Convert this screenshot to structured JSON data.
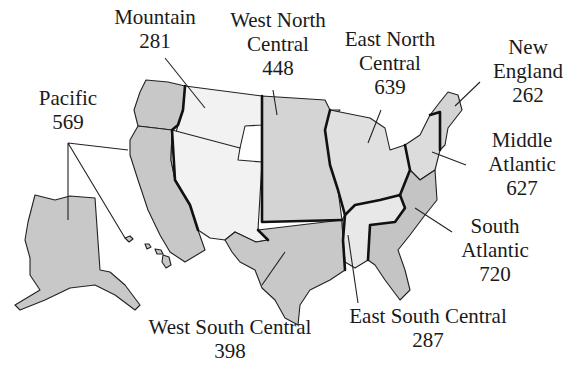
{
  "map": {
    "type": "choropleth-divisions",
    "subject": "United States census divisions",
    "colors": {
      "dark_fill": "#c8c8c8",
      "medium_fill": "#d9d9d9",
      "light_fill": "#f2f2f2",
      "border": "#111111",
      "background": "#ffffff"
    }
  },
  "divisions": [
    {
      "key": "pacific",
      "name_lines": [
        "Pacific"
      ],
      "value": "569"
    },
    {
      "key": "mountain",
      "name_lines": [
        "Mountain"
      ],
      "value": "281"
    },
    {
      "key": "west_north_central",
      "name_lines": [
        "West North",
        "Central"
      ],
      "value": "448"
    },
    {
      "key": "east_north_central",
      "name_lines": [
        "East North",
        "Central"
      ],
      "value": "639"
    },
    {
      "key": "new_england",
      "name_lines": [
        "New",
        "England"
      ],
      "value": "262"
    },
    {
      "key": "middle_atlantic",
      "name_lines": [
        "Middle",
        "Atlantic"
      ],
      "value": "627"
    },
    {
      "key": "south_atlantic",
      "name_lines": [
        "South",
        "Atlantic"
      ],
      "value": "720"
    },
    {
      "key": "east_south_central",
      "name_lines": [
        "East South Central"
      ],
      "value": "287"
    },
    {
      "key": "west_south_central",
      "name_lines": [
        "West South Central"
      ],
      "value": "398"
    }
  ]
}
